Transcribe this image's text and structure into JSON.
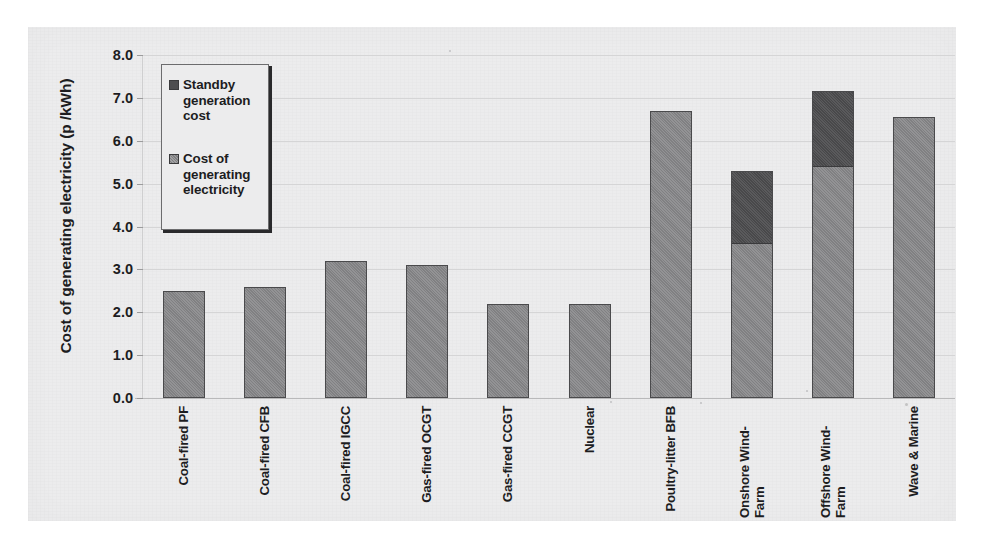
{
  "chart_data": {
    "type": "bar",
    "title": "",
    "subtitle": "",
    "xlabel": "",
    "ylabel": "Cost of generating electricity (p /kWh)",
    "ylim": [
      0.0,
      8.0
    ],
    "ytick_labels": [
      "8.0",
      "7.0",
      "6.0",
      "5.0",
      "4.0",
      "3.0",
      "2.0",
      "1.0",
      "0.0"
    ],
    "ytick_values": [
      8.0,
      7.0,
      6.0,
      5.0,
      4.0,
      3.0,
      2.0,
      1.0,
      0.0
    ],
    "grid": true,
    "stacked": true,
    "legend_position": "inside-top-left",
    "categories": [
      "Coal-fired PF",
      "Coal-fired CFB",
      "Coal-fired IGCC",
      "Gas-fired OCGT",
      "Gas-fired CCGT",
      "Nuclear",
      "Poultry-litter BFB",
      "Onshore Wind-Farm",
      "Offshore Wind-Farm",
      "Wave & Marine"
    ],
    "series": [
      {
        "name": "Cost of generating electricity",
        "color": "#878789",
        "values": [
          2.5,
          2.6,
          3.2,
          3.1,
          2.2,
          2.2,
          6.7,
          3.6,
          5.4,
          6.55
        ]
      },
      {
        "name": "Standby generation cost",
        "color": "#4e4e50",
        "values": [
          0.0,
          0.0,
          0.0,
          0.0,
          0.0,
          0.0,
          0.0,
          1.7,
          1.75,
          0.0
        ]
      }
    ],
    "totals": [
      2.5,
      2.6,
      3.2,
      3.1,
      2.2,
      2.2,
      6.7,
      5.3,
      7.15,
      6.55
    ]
  },
  "legend": {
    "entries": [
      {
        "label": "Standby generation cost",
        "swatch": "dark-grey-swatch-icon"
      },
      {
        "label": "Cost of generating electricity",
        "swatch": "mid-grey-swatch-icon"
      }
    ]
  },
  "colors": {
    "panel_background": "#ececed",
    "generation_fill": "#878789",
    "standby_fill": "#4e4e50",
    "bar_outline": "#4a4a4c",
    "gridline": "#d5d5d6",
    "text": "#1d1d1f"
  }
}
